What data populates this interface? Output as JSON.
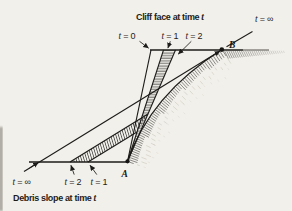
{
  "colors": {
    "background": "#f2f0ea",
    "ink": "#1d1c1a",
    "hatch": "#22211e",
    "faint_hachure": "#a59e8f"
  },
  "captions": {
    "cliff": {
      "text": "Cliff face at time",
      "var": " t"
    },
    "debris": {
      "text": "Debris slope at time",
      "var": " t"
    }
  },
  "time_labels": {
    "top_t0": {
      "var": "t",
      "eq": " = 0"
    },
    "top_t1": {
      "var": "t",
      "eq": " = 1"
    },
    "top_t2": {
      "var": "t",
      "eq": " = 2"
    },
    "top_inf": {
      "var": "t",
      "eq": " = ∞"
    },
    "bot_inf": {
      "var": "t",
      "eq": " = ∞"
    },
    "bot_t2": {
      "var": "t",
      "eq": " = 2"
    },
    "bot_t1": {
      "var": "t",
      "eq": " = 1"
    }
  },
  "points": {
    "A": "A",
    "B": "B"
  }
}
